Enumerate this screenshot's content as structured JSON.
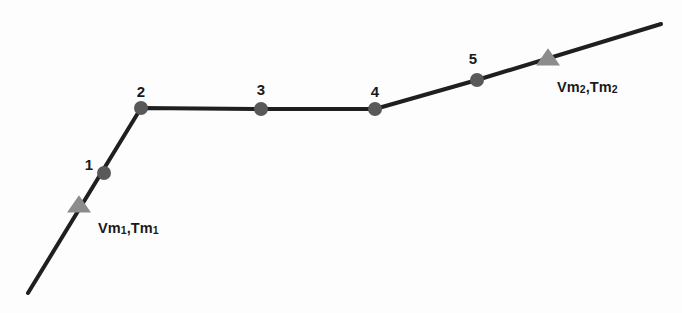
{
  "figure": {
    "background_color": "#ffffff",
    "line_color": "#1f1f1f",
    "node_color": "#595959",
    "triangle_color": "#8c8c8c",
    "text_color": "#1a1a1a"
  },
  "chart_data": {
    "type": "line",
    "title": "",
    "xlabel": "",
    "ylabel": "",
    "grid": false,
    "legend": "none",
    "xlim": [
      0,
      682
    ],
    "ylim": [
      0,
      313
    ],
    "note": "Coordinates are in screenshot pixel space; y increases downward.",
    "polyline": {
      "x": [
        28,
        141,
        261,
        375,
        477,
        661
      ],
      "y": [
        293,
        108,
        109,
        109,
        80,
        24
      ],
      "segments": [
        {
          "from": "start",
          "to": "2",
          "slope": "steep-rising"
        },
        {
          "from": "2",
          "to": "3",
          "slope": "flat"
        },
        {
          "from": "3",
          "to": "4",
          "slope": "flat"
        },
        {
          "from": "4",
          "to": "5",
          "slope": "gentle-rising"
        },
        {
          "from": "5",
          "to": "end",
          "slope": "gentle-rising"
        }
      ]
    },
    "nodes": [
      {
        "label": "1",
        "x": 104,
        "y": 173,
        "label_x": 89,
        "label_y": 164
      },
      {
        "label": "2",
        "x": 141,
        "y": 108,
        "label_x": 141,
        "label_y": 91
      },
      {
        "label": "3",
        "x": 261,
        "y": 109,
        "label_x": 261,
        "label_y": 89
      },
      {
        "label": "4",
        "x": 375,
        "y": 109,
        "label_x": 375,
        "label_y": 91
      },
      {
        "label": "5",
        "x": 477,
        "y": 80,
        "label_x": 473,
        "label_y": 58
      }
    ],
    "markers": [
      {
        "label": "Vm1,Tm1",
        "base": "Vm",
        "sub1": "1",
        "sep": ",Tm",
        "sub2": "1",
        "x": 79,
        "y": 205,
        "label_x": 98,
        "label_y": 221
      },
      {
        "label": "Vm2,Tm2",
        "base": "Vm",
        "sub1": "2",
        "sep": ",Tm",
        "sub2": "2",
        "x": 548,
        "y": 58,
        "label_x": 557,
        "label_y": 80
      }
    ]
  }
}
